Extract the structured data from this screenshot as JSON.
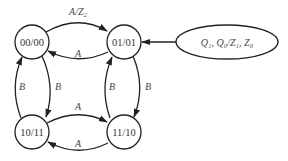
{
  "diagram": {
    "type": "state-transition",
    "states": [
      {
        "id": "s00",
        "label": "00/00"
      },
      {
        "id": "s01",
        "label": "01/01"
      },
      {
        "id": "s10",
        "label": "10/11"
      },
      {
        "id": "s11",
        "label": "11/10"
      }
    ],
    "transitions": [
      {
        "from": "00/00",
        "to": "01/01",
        "label": "A/Z₂"
      },
      {
        "from": "01/01",
        "to": "00/00",
        "label": "A"
      },
      {
        "from": "00/00",
        "to": "10/11",
        "label": "B"
      },
      {
        "from": "10/11",
        "to": "00/00",
        "label": "B"
      },
      {
        "from": "01/01",
        "to": "11/10",
        "label": "B"
      },
      {
        "from": "11/10",
        "to": "01/01",
        "label": "B"
      },
      {
        "from": "10/11",
        "to": "11/10",
        "label": "A"
      },
      {
        "from": "11/10",
        "to": "10/11",
        "label": "A"
      }
    ],
    "legend": {
      "label": "Q₁, Q₀/Z₁, Z₀",
      "points_to": "01/01"
    }
  }
}
